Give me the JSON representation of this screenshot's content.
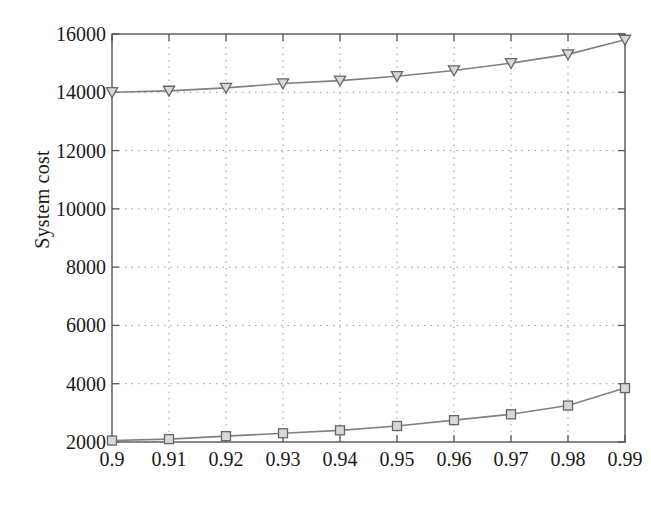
{
  "chart_data": {
    "type": "line",
    "title": "",
    "xlabel": "1-coverage probability",
    "ylabel": "System cost",
    "x": [
      0.9,
      0.91,
      0.92,
      0.93,
      0.94,
      0.95,
      0.96,
      0.97,
      0.98,
      0.99
    ],
    "xtick_labels": [
      "0.9",
      "0.91",
      "0.92",
      "0.93",
      "0.94",
      "0.95",
      "0.96",
      "0.97",
      "0.98",
      "0.99"
    ],
    "ytick_labels": [
      "2000",
      "4000",
      "6000",
      "8000",
      "10000",
      "12000",
      "14000",
      "16000"
    ],
    "yticks": [
      2000,
      4000,
      6000,
      8000,
      10000,
      12000,
      14000,
      16000
    ],
    "xlim": [
      0.9,
      0.99
    ],
    "ylim": [
      2000,
      16000
    ],
    "grid": true,
    "grid_style": "dotted",
    "legend": false,
    "legend_position": "none",
    "series": [
      {
        "name": "upper-series",
        "marker": "triangle-down",
        "color": "#808080",
        "values": [
          14000,
          14050,
          14150,
          14300,
          14400,
          14550,
          14750,
          15000,
          15300,
          15800
        ]
      },
      {
        "name": "lower-series",
        "marker": "square",
        "color": "#808080",
        "values": [
          2050,
          2100,
          2200,
          2300,
          2400,
          2550,
          2750,
          2950,
          3250,
          3850
        ]
      }
    ]
  },
  "colors": {
    "axis": "#555555",
    "grid": "#9a9a9a",
    "line": "#808080",
    "marker_fill": "#d8d8d8",
    "marker_stroke": "#666666",
    "background": "#ffffff",
    "text": "#1a1a1a"
  }
}
